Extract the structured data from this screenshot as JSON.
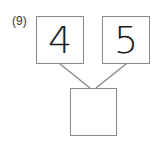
{
  "problem": {
    "label": "(9)",
    "left_number": "4",
    "right_number": "5",
    "answer": ""
  },
  "colors": {
    "border": "#8a8a8a",
    "text": "#1a1a1a"
  }
}
